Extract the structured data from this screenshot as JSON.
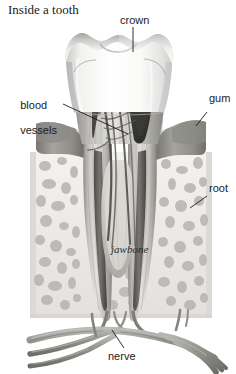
{
  "figure": {
    "title": "Inside a tooth",
    "background_color": "#ffffff",
    "style": "grayscale medical illustration, cutaway cross-section"
  },
  "labels": [
    {
      "id": "crown",
      "text": "crown",
      "icon": "leader-line-vertical"
    },
    {
      "id": "blood",
      "text": "blood\nvessels",
      "icon": "leader-line-diagonal"
    },
    {
      "id": "gum",
      "text": "gum",
      "icon": "leader-line-diagonal"
    },
    {
      "id": "root",
      "text": "root",
      "icon": "leader-line-diagonal"
    },
    {
      "id": "jawbone",
      "text": "jawbone",
      "icon": "inline-text-label"
    },
    {
      "id": "nerve",
      "text": "nerve",
      "icon": "leader-line-diagonal"
    }
  ],
  "label_text": {
    "crown": "crown",
    "blood_line1": "blood",
    "blood_line2": "vessels",
    "gum": "gum",
    "root": "root",
    "jawbone": "jawbone",
    "nerve": "nerve"
  },
  "colors": {
    "background": "#ffffff",
    "enamel_light": "#fbfbfa",
    "enamel_shadow": "#d9d9d7",
    "enamel_ridge": "#a8a8a6",
    "dentin_light": "#e2e1de",
    "dentin_mid": "#bdbcb8",
    "dentin_dark": "#8e8d89",
    "pulp_dark": "#4c4b49",
    "pulp_deep": "#2f2e2d",
    "gum_tissue": "#9a9a98",
    "gum_tissue_light": "#b9b9b6",
    "bone_matrix": "#eceae6",
    "bone_spongy": "#b6b4b0",
    "bone_outline": "#cfcdc9",
    "nerve_tube": "#8b8a87",
    "nerve_tube_light": "#b4b3b0",
    "vessel_dark": "#5a5956",
    "leader_line": "#1a1a1a",
    "text": "#1a1a1a"
  },
  "structures": [
    {
      "name": "crown",
      "description": "cusped enamel cap at top of tooth"
    },
    {
      "name": "enamel",
      "description": "white outer layer of crown"
    },
    {
      "name": "dentin",
      "description": "striated mid layer beneath enamel"
    },
    {
      "name": "pulp-chamber",
      "description": "dark central cavity holding nerves and vessels"
    },
    {
      "name": "blood-vessels",
      "description": "vessel strands entering pulp chamber"
    },
    {
      "name": "gum",
      "description": "soft tissue collar around tooth neck"
    },
    {
      "name": "root",
      "description": "two tapering roots embedded in bone"
    },
    {
      "name": "root-canal",
      "description": "dark channels running down each root"
    },
    {
      "name": "jawbone",
      "description": "spongy trabecular bone surrounding roots"
    },
    {
      "name": "nerve",
      "description": "nerve bundles branching below the jawbone"
    }
  ]
}
